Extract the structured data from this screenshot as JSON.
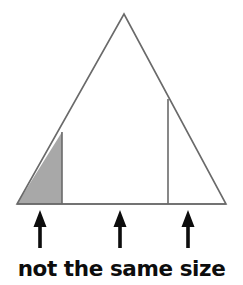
{
  "figure": {
    "caption": "not the same size",
    "background_color": "#ffffff",
    "outline_color": "#6a6a6a",
    "shaded_fill_color": "#a8a8a8",
    "arrow_color": "#0d0d0d",
    "caption_color": "#0d0d0d",
    "title": "Triangle divided by two vertical lines with three upward arrows",
    "stroke_width": 1.6,
    "triangle": {
      "name": "outer-triangle",
      "apex": {
        "x": 124,
        "y": 14
      },
      "bottom_left": {
        "x": 17,
        "y": 204
      },
      "bottom_right": {
        "x": 226,
        "y": 204
      },
      "points": "124,14 226,204 17,204"
    },
    "shaded_region": {
      "name": "shaded-left-triangle",
      "label": "shaded sub-triangle",
      "points": "17,204 62,204 62,132"
    },
    "dividers": [
      {
        "name": "left-divider",
        "x": 62,
        "y_top": 132,
        "y_bottom": 204
      },
      {
        "name": "right-divider",
        "x": 168,
        "y_top": 99,
        "y_bottom": 204
      }
    ],
    "baseline": {
      "name": "triangle-base",
      "x1": 17,
      "x2": 226,
      "y": 204
    },
    "arrows": [
      {
        "name": "arrow-left",
        "label": "arrow pointing at shaded region",
        "x": 40,
        "tip_y": 210,
        "tail_y": 248,
        "head_width": 13,
        "head_height": 17,
        "shaft_width": 3.6
      },
      {
        "name": "arrow-middle",
        "label": "arrow pointing at middle region",
        "x": 120,
        "tip_y": 210,
        "tail_y": 248,
        "head_width": 13,
        "head_height": 17,
        "shaft_width": 3.6
      },
      {
        "name": "arrow-right",
        "label": "arrow pointing at right region",
        "x": 188,
        "tip_y": 210,
        "tail_y": 248,
        "head_width": 13,
        "head_height": 17,
        "shaft_width": 3.6
      }
    ]
  }
}
